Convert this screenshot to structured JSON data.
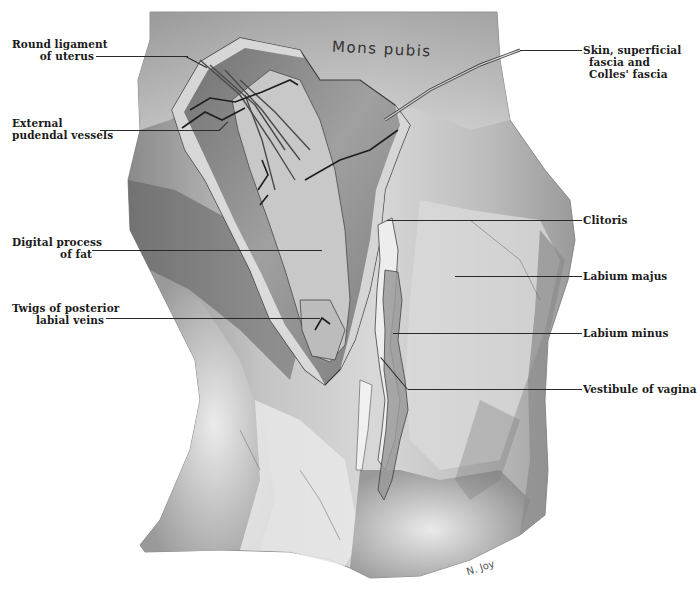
{
  "figure": {
    "inline_labels": {
      "mons_pubis": "Mons pubis",
      "signature": "N. Joy"
    },
    "labels_left": [
      {
        "id": "round-ligament",
        "lines": [
          "Round ligament",
          "of uterus"
        ]
      },
      {
        "id": "external-pudendal-vessels",
        "lines": [
          "External",
          "pudendal vessels"
        ]
      },
      {
        "id": "digital-process",
        "lines": [
          "Digital process",
          "of fat"
        ]
      },
      {
        "id": "twigs-labial-veins",
        "lines": [
          "Twigs of posterior",
          "labial veins"
        ]
      }
    ],
    "labels_right": [
      {
        "id": "skin-fascia",
        "lines": [
          "Skin, superficial",
          "fascia and",
          "Colles' fascia"
        ]
      },
      {
        "id": "clitoris",
        "lines": [
          "Clitoris"
        ]
      },
      {
        "id": "labium-majus",
        "lines": [
          "Labium majus"
        ]
      },
      {
        "id": "labium-minus",
        "lines": [
          "Labium minus"
        ]
      },
      {
        "id": "vestibule",
        "lines": [
          "Vestibule of vagina"
        ]
      }
    ],
    "colors": {
      "ink": "#1a1a1a",
      "background": "#ffffff",
      "tissue_light": "#e6e6e6",
      "tissue_mid": "#a8a8a8",
      "tissue_dark": "#5a5a5a"
    }
  }
}
